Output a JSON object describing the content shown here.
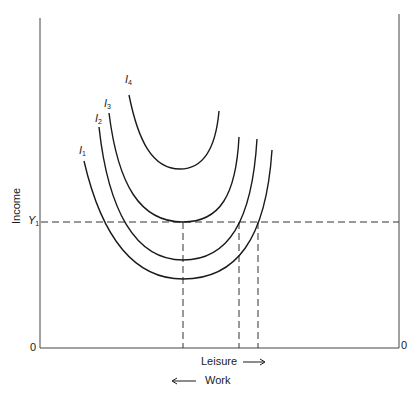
{
  "diagram": {
    "y_axis_label": "Income",
    "x_axis_label": "Leisure",
    "x_axis_label_direction": "right-arrow",
    "secondary_label": "Work",
    "secondary_label_direction": "left-arrow",
    "origin_left": "0",
    "origin_right": "0",
    "income_level": {
      "symbol": "Y",
      "subscript": "1"
    },
    "curves": [
      {
        "symbol": "I",
        "subscript": "1"
      },
      {
        "symbol": "I",
        "subscript": "2"
      },
      {
        "symbol": "I",
        "subscript": "3"
      },
      {
        "symbol": "I",
        "subscript": "4"
      }
    ],
    "colors": {
      "line": "#1a1a1a",
      "background": "#ffffff"
    }
  }
}
